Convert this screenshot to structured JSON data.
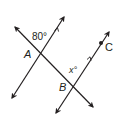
{
  "diagram": {
    "colors": {
      "stroke": "#231f20",
      "background": "#ffffff"
    },
    "labels": {
      "angle_given": "80°",
      "angle_unknown": "x°",
      "point_a": "A",
      "point_b": "B",
      "point_c": "C"
    },
    "lines": [
      {
        "name": "parallel-line-1",
        "from": [
          12,
          98
        ],
        "to": [
          64,
          17
        ],
        "marker": "parallel-arrow"
      },
      {
        "name": "parallel-line-2",
        "from": [
          56,
          113
        ],
        "to": [
          109,
          32
        ],
        "marker": "parallel-arrow"
      },
      {
        "name": "transversal",
        "from": [
          15,
          27
        ],
        "to": [
          93,
          107
        ]
      }
    ],
    "points": [
      {
        "label": "A",
        "at": [
          40,
          53
        ]
      },
      {
        "label": "B",
        "at": [
          73,
          87
        ]
      },
      {
        "label": "C",
        "at": [
          101,
          43
        ],
        "dot": true
      }
    ]
  }
}
